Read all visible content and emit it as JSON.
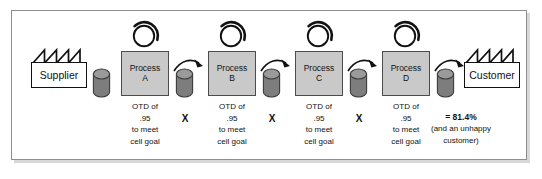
{
  "diagram": {
    "endpoints": {
      "supplier": {
        "label": "Supplier",
        "icon": "factory-icon"
      },
      "customer": {
        "label": "Customer",
        "icon": "factory-icon"
      }
    },
    "process_label": "Process",
    "loop_icon": "rotation-loop-icon",
    "inventory_icon": "cylinder-inventory-icon",
    "arrow_icon": "curved-arrow-icon",
    "operator": "X",
    "processes": [
      {
        "name": "Process",
        "letter": "A",
        "caption": [
          "OTD of",
          ".95",
          "to meet",
          "cell goal"
        ],
        "otd": ".95"
      },
      {
        "name": "Process",
        "letter": "B",
        "caption": [
          "OTD of",
          ".95",
          "to meet",
          "cell goal"
        ],
        "otd": ".95"
      },
      {
        "name": "Process",
        "letter": "C",
        "caption": [
          "OTD of",
          ".95",
          "to meet",
          "cell goal"
        ],
        "otd": ".95"
      },
      {
        "name": "Process",
        "letter": "D",
        "caption": [
          "OTD of",
          ".95",
          "to meet",
          "cell goal"
        ],
        "otd": ".95"
      }
    ],
    "result": {
      "total": "= 81.4%",
      "note_line1": "(and an unhappy",
      "note_line2": "customer)"
    }
  },
  "colors": {
    "process_fill": "#c9c9c9",
    "process_stroke": "#4c4c4c",
    "cylinder_fill": "#7d7d7d",
    "cylinder_top": "#9a9a9a",
    "frame_stroke": "#8e8e8e",
    "frame_shadow": "#d8d8d8",
    "text": "#111111",
    "page_background": "#ffffff"
  }
}
